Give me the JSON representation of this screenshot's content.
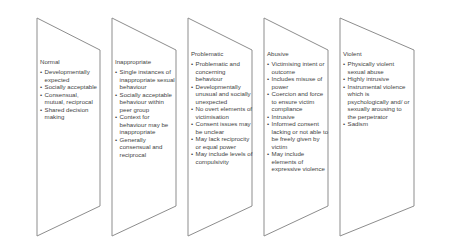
{
  "diagram": {
    "type": "continuum-banner-chevrons",
    "stroke_color": "#8d8d8d",
    "fill_color": "#ffffff",
    "text_color": "#3f3f3f",
    "bullet_glyph": "•",
    "panels": [
      {
        "heading": "Normal",
        "bullets": [
          "Developmentally expected",
          "Socially acceptable",
          "Consensual, mutual, reciprocal",
          "Shared decision making"
        ]
      },
      {
        "heading": "Inappropriate",
        "bullets": [
          "Single instances of inappropriate sexual behaviour",
          "Socially acceptable behaviour within peer group",
          "Context for behaviour may be inappropriate",
          "Generally consensual and reciprocal"
        ]
      },
      {
        "heading": "Problematic",
        "bullets": [
          "Problematic and concerning behaviour",
          "Developmentally unusual and socially unexpected",
          "No overt elements of victimisation",
          "Consent issues may be unclear",
          "May lack reciprocity or equal power",
          "May include levels of compulsivity"
        ]
      },
      {
        "heading": "Abusive",
        "bullets": [
          "Victimising intent or outcome",
          "Includes misuse of power",
          "Coercion and force to ensure victim compliance",
          "Intrusive",
          "Informed consent lacking or not able to be freely given by victim",
          "May include elements of expressive violence"
        ]
      },
      {
        "heading": "Violent",
        "bullets": [
          "Physically violent sexual abuse",
          "Highly intrusive",
          "Instrumental violence which is psychologically and/ or sexually arousing to the perpetrator",
          "Sadism"
        ]
      }
    ]
  }
}
